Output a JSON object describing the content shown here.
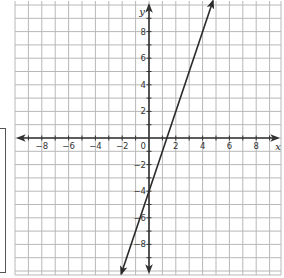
{
  "chart_data": {
    "type": "line",
    "title": "",
    "xlabel": "x",
    "ylabel": "y",
    "xlim": [
      -9.9,
      9.9
    ],
    "ylim": [
      -10.3,
      10.3
    ],
    "grid": true,
    "x_ticks": [
      -8,
      -6,
      -4,
      -2,
      0,
      2,
      4,
      6,
      8
    ],
    "y_ticks": [
      -8,
      -6,
      -4,
      -2,
      2,
      4,
      6,
      8
    ],
    "x_tick_labels": [
      "−8",
      "−6",
      "−4",
      "−2",
      "0",
      "2",
      "4",
      "6",
      "8"
    ],
    "y_tick_labels": [
      "−8",
      "−6",
      "−4",
      "−2",
      "2",
      "4",
      "6",
      "8"
    ],
    "origin_label": "0",
    "series": [
      {
        "name": "line",
        "equation": "y = 3x − 4",
        "slope": 3,
        "intercept": -4,
        "x": [
          -2.07,
          4.77
        ],
        "y": [
          -10.2,
          10.3
        ],
        "arrows": "both"
      }
    ],
    "legend": null
  },
  "colors": {
    "grid": "#b8b8b8",
    "axis": "#333333",
    "line": "#2a2a2a",
    "background": "#ffffff"
  }
}
